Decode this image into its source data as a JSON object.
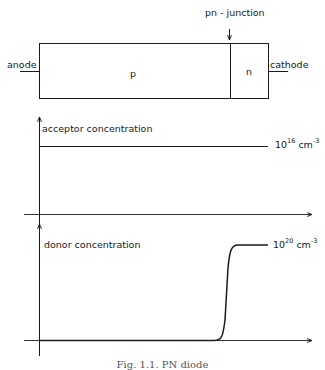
{
  "device": {
    "junction_label": "pn - junction",
    "anode_label": "anode",
    "cathode_label": "cathode",
    "p_region_label": "p",
    "n_region_label": "n"
  },
  "acceptor_plot": {
    "label": "acceptor concentration",
    "value_base": "10",
    "value_exp": "16",
    "value_unit": " cm",
    "value_unit_exp": "-3"
  },
  "donor_plot": {
    "label": "donor concentration",
    "value_base": "10",
    "value_exp": "20",
    "value_unit": " cm",
    "value_unit_exp": "-3"
  },
  "caption": "Fig. 1.1. PN diode",
  "colors": {
    "line": "#1a1a1a",
    "background": "#ffffff"
  }
}
